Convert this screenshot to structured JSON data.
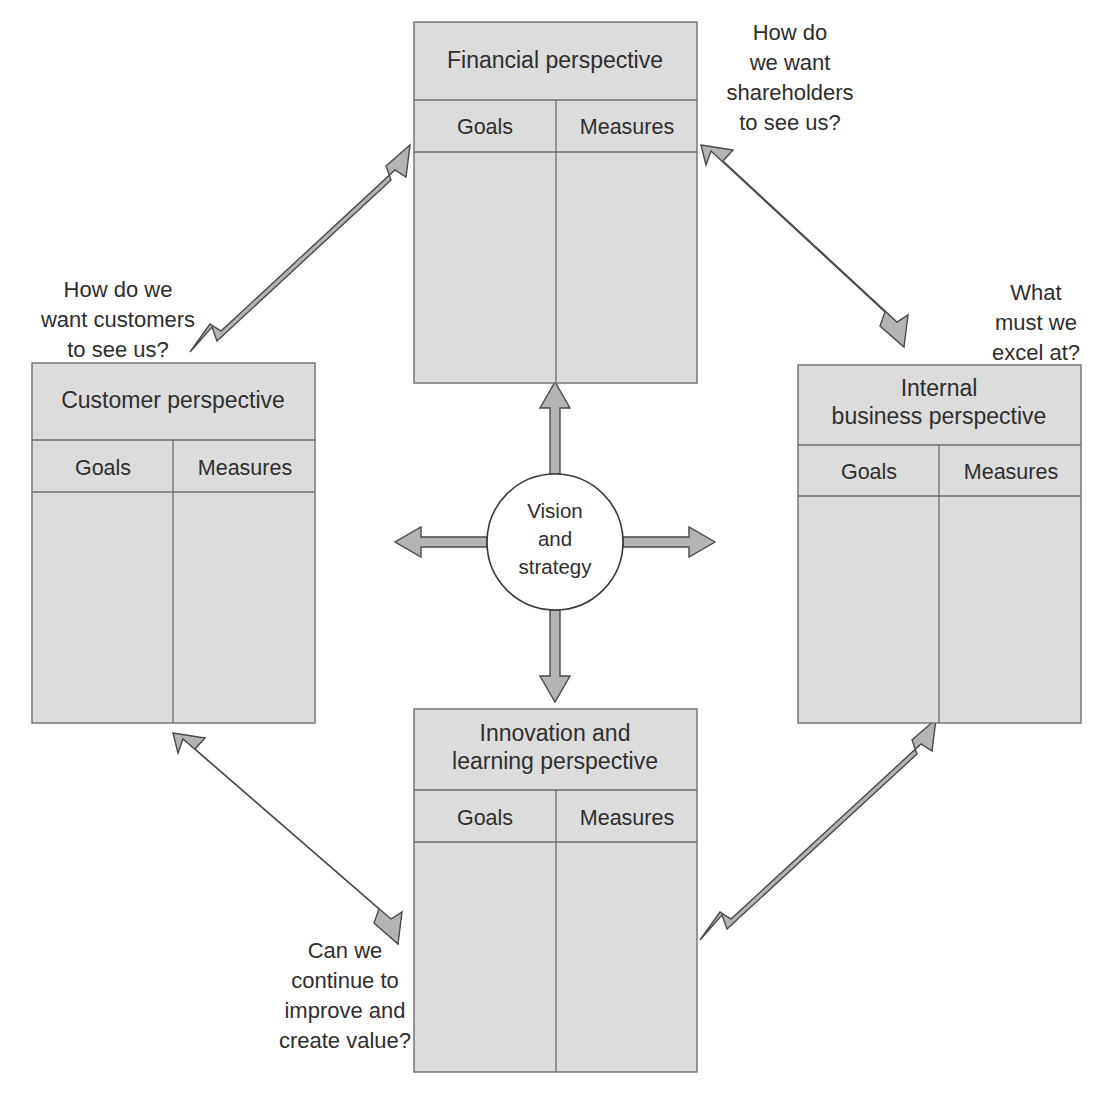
{
  "diagram": {
    "center": {
      "label_lines": [
        "Vision",
        "and",
        "strategy"
      ]
    },
    "column_headers": [
      "Goals",
      "Measures"
    ],
    "panels": [
      {
        "id": "financial",
        "title_lines": [
          "Financial perspective"
        ],
        "goals_label": "Goals",
        "measures_label": "Measures"
      },
      {
        "id": "customer",
        "title_lines": [
          "Customer perspective"
        ],
        "goals_label": "Goals",
        "measures_label": "Measures"
      },
      {
        "id": "internal-business",
        "title_lines": [
          "Internal",
          "business perspective"
        ],
        "goals_label": "Goals",
        "measures_label": "Measures"
      },
      {
        "id": "innovation-learning",
        "title_lines": [
          "Innovation and",
          "learning perspective"
        ],
        "goals_label": "Goals",
        "measures_label": "Measures"
      }
    ],
    "questions": [
      {
        "id": "shareholders",
        "lines": [
          "How do",
          "we want",
          "shareholders",
          "to see us?"
        ]
      },
      {
        "id": "customers",
        "lines": [
          "How do we",
          "want customers",
          "to see us?"
        ]
      },
      {
        "id": "excel",
        "lines": [
          "What",
          "must we",
          "excel at?"
        ]
      },
      {
        "id": "improve",
        "lines": [
          "Can we",
          "continue to",
          "improve and",
          "create value?"
        ]
      }
    ],
    "colors": {
      "panel_fill": "#dcdcdc",
      "panel_stroke": "#6e6e6e",
      "arrow_fill": "#b4b4b4",
      "arrow_stroke": "#4a4a4a",
      "text": "#2e2e2e",
      "background": "#ffffff"
    }
  }
}
